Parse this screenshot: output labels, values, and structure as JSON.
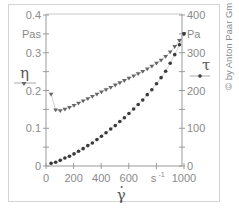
{
  "chart_data": {
    "type": "scatter",
    "title": "",
    "xlabel": "γ̇",
    "x_unit": "s-1",
    "ylabel_left": "η",
    "ylabel_left_unit": "Pas",
    "ylabel_right": "τ",
    "ylabel_right_unit": "Pa",
    "xlim": [
      0,
      1000
    ],
    "ylim_left": [
      0,
      0.4
    ],
    "ylim_right": [
      0,
      400
    ],
    "x_ticks": [
      "0",
      "200",
      "400",
      "600",
      "s-1",
      "1000"
    ],
    "y_left_ticks": [
      "0",
      "0.1",
      "0.2",
      "0.3",
      "Pas",
      "0.4"
    ],
    "y_right_ticks": [
      "0",
      "100",
      "200",
      "300",
      "Pa",
      "400"
    ],
    "grid": false,
    "legend": [
      {
        "name": "η",
        "marker": "triangle-down",
        "axis": "left"
      },
      {
        "name": "τ",
        "marker": "circle",
        "axis": "right"
      }
    ],
    "x": [
      37,
      70,
      103,
      137,
      170,
      203,
      236,
      269,
      303,
      336,
      369,
      402,
      435,
      469,
      502,
      535,
      568,
      601,
      635,
      668,
      701,
      734,
      767,
      801,
      834,
      867,
      900,
      933,
      967,
      1000
    ],
    "series": [
      {
        "name": "η",
        "axis": "left",
        "marker": "triangle-down",
        "values": [
          0.19,
          0.148,
          0.146,
          0.15,
          0.155,
          0.16,
          0.166,
          0.172,
          0.178,
          0.184,
          0.19,
          0.196,
          0.202,
          0.208,
          0.214,
          0.22,
          0.226,
          0.232,
          0.238,
          0.244,
          0.25,
          0.257,
          0.264,
          0.272,
          0.28,
          0.29,
          0.302,
          0.316,
          0.332,
          0.35
        ]
      },
      {
        "name": "τ",
        "axis": "right",
        "marker": "circle",
        "values": [
          7,
          10,
          15,
          21,
          26,
          32,
          39,
          46,
          54,
          61,
          70,
          79,
          88,
          98,
          107,
          118,
          128,
          139,
          151,
          163,
          175,
          189,
          202,
          218,
          234,
          251,
          272,
          295,
          321,
          350
        ]
      }
    ]
  },
  "copyright": "© by Anton Paar GmbH",
  "colors": {
    "eta_marker": "#666666",
    "tau_marker": "#3a3a3a",
    "axis": "#9a9a9a",
    "frame": "#d4d4d4"
  }
}
